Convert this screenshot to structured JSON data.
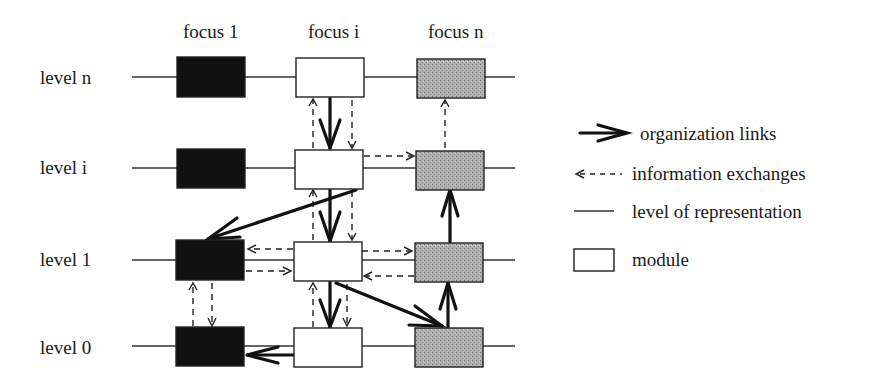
{
  "columns": [
    {
      "label": "focus 1",
      "x": 211,
      "fill": "#111111"
    },
    {
      "label": "focus i",
      "x": 329,
      "fill": "#ffffff"
    },
    {
      "label": "focus n",
      "x": 450,
      "fill": "#a8a8a8"
    }
  ],
  "rows": [
    {
      "label": "level n",
      "y": 77
    },
    {
      "label": "level i",
      "y": 168
    },
    {
      "label": "level 1",
      "y": 260
    },
    {
      "label": "level 0",
      "y": 346
    }
  ],
  "legend": {
    "organization_links": "organization links",
    "information_exchanges": "information exchanges",
    "level_of_representation": "level of representation",
    "module": "module"
  },
  "colors": {
    "ink": "#1a1a1a",
    "focus1_fill": "#111111",
    "focusi_fill": "#ffffff",
    "focusn_fill": "#a8a8a8"
  }
}
